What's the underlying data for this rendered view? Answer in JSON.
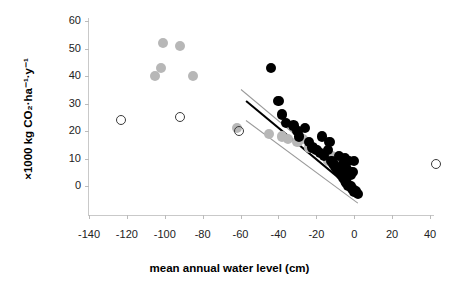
{
  "figure": {
    "background_color": "#ffffff",
    "marker_colors": {
      "black": "#000000",
      "gray": "#b7b7b7",
      "open": "#3a3a3a",
      "fit_line": "#000000",
      "ci_line": "#9a9a9a"
    }
  },
  "chart_data": {
    "type": "scatter",
    "title": "",
    "xlabel": "mean annual water level (cm)",
    "ylabel": "×1000 kg CO₂·ha⁻¹·y⁻¹",
    "xlim": [
      -150,
      48
    ],
    "ylim": [
      -8,
      62
    ],
    "xticks": [
      -140,
      -120,
      -100,
      -80,
      -60,
      -40,
      -20,
      0,
      20,
      40
    ],
    "xticklabels": [
      "-140",
      "-120",
      "-100",
      "-80",
      "-60",
      "-40",
      "-20",
      "0",
      "20",
      "40"
    ],
    "yticks": [
      0,
      10,
      20,
      30,
      40,
      50,
      60
    ],
    "yticklabels": [
      "0",
      "10",
      "20",
      "30",
      "40",
      "50",
      "60"
    ],
    "grid": false,
    "legend": null,
    "series": [
      {
        "name": "gray-filled",
        "marker": "filled-circle",
        "color": "#b7b7b7",
        "points": [
          [
            -101,
            52
          ],
          [
            -92,
            51
          ],
          [
            -102,
            43
          ],
          [
            -105,
            40
          ],
          [
            -85,
            40
          ],
          [
            -62,
            21
          ],
          [
            -45,
            19
          ],
          [
            -38,
            18
          ],
          [
            -35,
            17
          ],
          [
            -30,
            16
          ],
          [
            -27,
            17
          ],
          [
            -24,
            14
          ],
          [
            -20,
            13
          ],
          [
            -16,
            12
          ],
          [
            -12,
            11
          ],
          [
            -14,
            9
          ],
          [
            -9,
            8
          ],
          [
            -7,
            7
          ],
          [
            -5,
            6
          ],
          [
            -3,
            4
          ]
        ]
      },
      {
        "name": "black-filled",
        "marker": "filled-circle",
        "color": "#000000",
        "points": [
          [
            -44,
            43
          ],
          [
            -40,
            31
          ],
          [
            -38,
            26
          ],
          [
            -36,
            23
          ],
          [
            -32,
            22
          ],
          [
            -30,
            20
          ],
          [
            -29,
            18
          ],
          [
            -26,
            21
          ],
          [
            -24,
            16
          ],
          [
            -22,
            14
          ],
          [
            -20,
            13
          ],
          [
            -18,
            12
          ],
          [
            -16,
            11
          ],
          [
            -14,
            13
          ],
          [
            -12,
            9
          ],
          [
            -11,
            8
          ],
          [
            -10,
            7
          ],
          [
            -9,
            6
          ],
          [
            -8,
            5
          ],
          [
            -7,
            4
          ],
          [
            -6,
            3
          ],
          [
            -5,
            2
          ],
          [
            -4,
            1
          ],
          [
            -3,
            0
          ],
          [
            -2,
            0
          ],
          [
            -1,
            -1
          ],
          [
            0,
            -2
          ],
          [
            1,
            -2
          ],
          [
            2,
            -3
          ],
          [
            -2,
            4
          ],
          [
            -4,
            6
          ],
          [
            -6,
            8
          ],
          [
            -3,
            9
          ],
          [
            0,
            9
          ],
          [
            -1,
            5
          ],
          [
            -5,
            10
          ],
          [
            -8,
            11
          ],
          [
            -13,
            16
          ],
          [
            -17,
            18
          ]
        ]
      },
      {
        "name": "open-circle",
        "marker": "open-circle",
        "color": "#3a3a3a",
        "points": [
          [
            -123,
            24
          ],
          [
            -92,
            25
          ],
          [
            -61,
            20
          ],
          [
            43,
            8
          ]
        ]
      }
    ],
    "lines": [
      {
        "name": "regression-fit",
        "style": "solid-thick",
        "color": "#000000",
        "x0": -57,
        "y0": 31,
        "x1": -1,
        "y1": -1
      },
      {
        "name": "confidence-upper",
        "style": "solid-thin",
        "color": "#9a9a9a",
        "x0": -60,
        "y0": 35,
        "x1": -1,
        "y1": 1
      },
      {
        "name": "confidence-lower",
        "style": "solid-thin",
        "color": "#9a9a9a",
        "x0": -57,
        "y0": 24,
        "x1": 2,
        "y1": -6
      }
    ]
  }
}
